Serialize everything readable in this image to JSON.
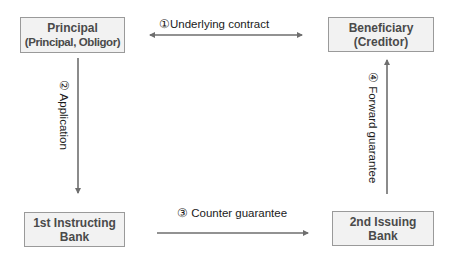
{
  "nodes": {
    "principal": {
      "title": "Principal",
      "subtitle": "(Principal, Obligor)"
    },
    "beneficiary": {
      "title": "Beneficiary",
      "subtitle": "(Creditor)"
    },
    "instructing_bank": {
      "title": "1st Instructing",
      "subtitle": "Bank"
    },
    "issuing_bank": {
      "title": "2nd Issuing",
      "subtitle": "Bank"
    }
  },
  "edges": {
    "underlying_contract": {
      "label": "①Underlying contract",
      "from": "principal",
      "to": "beneficiary",
      "direction": "both"
    },
    "application": {
      "label": "② Application",
      "from": "principal",
      "to": "instructing_bank",
      "direction": "forward"
    },
    "counter_guarantee": {
      "label": "③ Counter guarantee",
      "from": "instructing_bank",
      "to": "issuing_bank",
      "direction": "forward"
    },
    "forward_guarantee": {
      "label": "④ Forward guarantee",
      "from": "issuing_bank",
      "to": "beneficiary",
      "direction": "forward"
    }
  },
  "colors": {
    "box_fill": "#f2f2f2",
    "box_border": "#9a9a9a",
    "box_text": "#4a4a4a",
    "arrow": "#6e6e6e",
    "label_text": "#1a1a1a"
  }
}
